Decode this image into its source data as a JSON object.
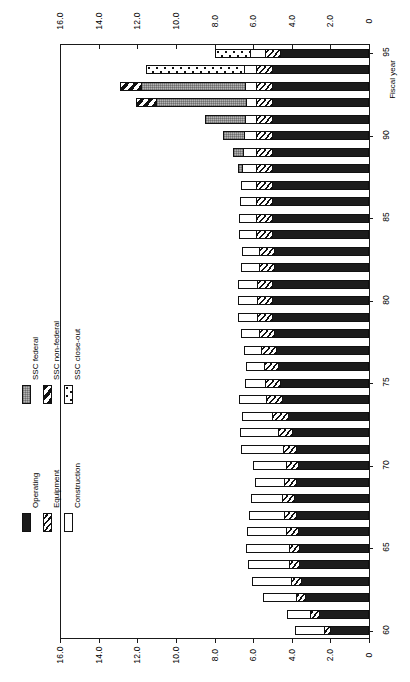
{
  "chart_data": {
    "type": "bar",
    "orientation": "horizontal-rotated",
    "title": "",
    "xlabel": "Fiscal year",
    "ylabel": "",
    "ylim": [
      0,
      16.0
    ],
    "grid": false,
    "value_ticks": [
      "0",
      "2.0",
      "4.0",
      "6.0",
      "8.0",
      "10.0",
      "12.0",
      "14.0",
      "16.0"
    ],
    "value_tick_values": [
      0,
      2,
      4,
      6,
      8,
      10,
      12,
      14,
      16
    ],
    "value_axis_duplicated": true,
    "category_axis_label": "Fiscal year",
    "category_ticks": [
      "60",
      "65",
      "70",
      "75",
      "80",
      "85",
      "90",
      "95"
    ],
    "categories": [
      "60",
      "61",
      "62",
      "63",
      "64",
      "65",
      "66",
      "67",
      "68",
      "69",
      "70",
      "71",
      "72",
      "73",
      "74",
      "75",
      "76",
      "77",
      "78",
      "79",
      "80",
      "81",
      "82",
      "83",
      "84",
      "85",
      "86",
      "87",
      "88",
      "89",
      "90",
      "91",
      "92",
      "93",
      "94",
      "95"
    ],
    "legend_position": "left",
    "series": [
      {
        "name": "Operating",
        "pattern": "solid-black",
        "values": [
          2.0,
          2.6,
          3.3,
          3.5,
          3.6,
          3.6,
          3.7,
          3.8,
          3.9,
          3.8,
          3.7,
          3.8,
          4.0,
          4.2,
          4.5,
          4.6,
          4.7,
          4.8,
          4.9,
          5.0,
          5.0,
          5.0,
          4.9,
          4.9,
          5.0,
          5.0,
          5.0,
          5.0,
          5.0,
          5.0,
          5.0,
          5.0,
          5.0,
          5.0,
          5.0,
          4.6
        ]
      },
      {
        "name": "Equipment",
        "pattern": "diagonal-hatch-fine",
        "values": [
          0.35,
          0.45,
          0.5,
          0.55,
          0.55,
          0.55,
          0.6,
          0.6,
          0.6,
          0.6,
          0.6,
          0.65,
          0.7,
          0.8,
          0.85,
          0.8,
          0.75,
          0.8,
          0.8,
          0.8,
          0.8,
          0.8,
          0.8,
          0.8,
          0.85,
          0.85,
          0.85,
          0.85,
          0.85,
          0.85,
          0.85,
          0.85,
          0.85,
          0.85,
          0.85,
          0.8
        ]
      },
      {
        "name": "Construction",
        "pattern": "white",
        "values": [
          1.5,
          1.2,
          1.7,
          2.0,
          2.1,
          2.2,
          2.0,
          1.8,
          1.6,
          1.5,
          1.7,
          2.2,
          2.0,
          1.6,
          1.4,
          1.0,
          0.9,
          0.9,
          0.95,
          1.0,
          1.0,
          1.0,
          0.95,
          0.9,
          0.9,
          0.9,
          0.85,
          0.8,
          0.75,
          0.7,
          0.6,
          0.55,
          0.5,
          0.55,
          0.6,
          0.75
        ]
      },
      {
        "name": "SSC federal",
        "pattern": "gray-stipple",
        "values": [
          0,
          0,
          0,
          0,
          0,
          0,
          0,
          0,
          0,
          0,
          0,
          0,
          0,
          0,
          0,
          0,
          0,
          0,
          0,
          0,
          0,
          0,
          0,
          0,
          0,
          0,
          0,
          0,
          0.2,
          0.5,
          1.1,
          2.1,
          4.7,
          5.4,
          0,
          0
        ]
      },
      {
        "name": "SSC non-federal",
        "pattern": "diagonal-hatch-bold",
        "values": [
          0,
          0,
          0,
          0,
          0,
          0,
          0,
          0,
          0,
          0,
          0,
          0,
          0,
          0,
          0,
          0,
          0,
          0,
          0,
          0,
          0,
          0,
          0,
          0,
          0,
          0,
          0,
          0,
          0,
          0,
          0,
          0,
          1.0,
          1.1,
          0,
          0
        ]
      },
      {
        "name": "SSC close-out",
        "pattern": "dotted",
        "values": [
          0,
          0,
          0,
          0,
          0,
          0,
          0,
          0,
          0,
          0,
          0,
          0,
          0,
          0,
          0,
          0,
          0,
          0,
          0,
          0,
          0,
          0,
          0,
          0,
          0,
          0,
          0,
          0,
          0,
          0,
          0,
          0,
          0,
          0,
          5.1,
          1.8
        ]
      }
    ]
  },
  "legend": {
    "left_column": [
      {
        "label": "Operating",
        "pattern": "op"
      },
      {
        "label": "Equipment",
        "pattern": "eq"
      },
      {
        "label": "Construction",
        "pattern": "cn"
      }
    ],
    "right_column": [
      {
        "label": "SSC federal",
        "pattern": "sf"
      },
      {
        "label": "SSC non-federal",
        "pattern": "sn"
      },
      {
        "label": "SSC close-out",
        "pattern": "sc"
      }
    ]
  },
  "axis": {
    "category_title": "Fiscal year",
    "value_ticks_top": [
      "16.0",
      "14.0",
      "12.0",
      "10.0",
      "8.0",
      "6.0",
      "4.0",
      "2.0",
      "0"
    ],
    "value_ticks_bottom": [
      "16.0",
      "14.0",
      "12.0",
      "10.0",
      "8.0",
      "6.0",
      "4.0",
      "2.0",
      "0"
    ],
    "year_ticks": [
      "95",
      "90",
      "85",
      "80",
      "75",
      "70",
      "65",
      "60"
    ]
  },
  "colors": {
    "ink": "#1a1a1a",
    "operating": "#1c1c1c",
    "ssc_federal": "#b4b4b4",
    "background": "#ffffff"
  }
}
